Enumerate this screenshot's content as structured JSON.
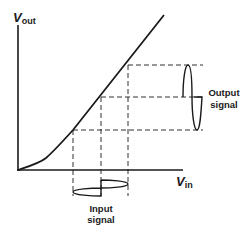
{
  "diagram": {
    "y_axis": {
      "label_main": "V",
      "label_sub": "out"
    },
    "x_axis": {
      "label_main": "V",
      "label_sub": "in"
    },
    "output_label": {
      "line1": "Output",
      "line2": "signal"
    },
    "input_label": {
      "line1": "Input",
      "line2": "signal"
    },
    "colors": {
      "stroke": "#1a1a1a",
      "background": "#ffffff"
    }
  }
}
